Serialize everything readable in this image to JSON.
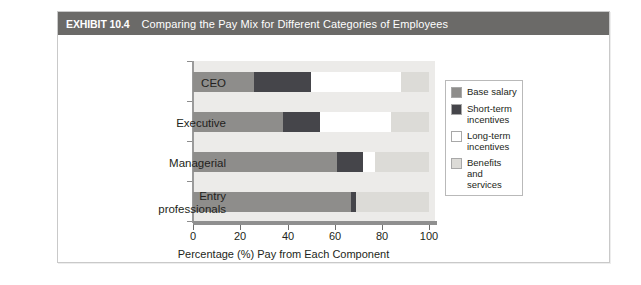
{
  "header": {
    "tag": "EXHIBIT 10.4",
    "title": "Comparing the Pay Mix for Different Categories of Employees"
  },
  "chart_data": {
    "type": "bar",
    "orientation": "horizontal",
    "stacked": true,
    "stack_mode": "percent",
    "title": "Comparing the Pay Mix for Different Categories of Employees",
    "xlabel": "Percentage (%) Pay from Each Component",
    "ylabel": "",
    "xlim": [
      0,
      100
    ],
    "xticks": [
      0,
      20,
      40,
      60,
      80,
      100
    ],
    "xticklabels": [
      "0",
      "20",
      "40",
      "60",
      "80",
      "100"
    ],
    "grid": false,
    "legend_position": "right",
    "categories": [
      "CEO",
      "Executive",
      "Managerial",
      "Entry professionals"
    ],
    "category_labels": [
      {
        "line1": "CEO",
        "line2": ""
      },
      {
        "line1": "Executive",
        "line2": ""
      },
      {
        "line1": "Managerial",
        "line2": ""
      },
      {
        "line1": "Entry",
        "line2": "professionals"
      }
    ],
    "series": [
      {
        "name": "Base salary",
        "color": "#8e8d8b",
        "values": [
          26,
          38,
          61,
          67
        ]
      },
      {
        "name": "Short-term incentives",
        "color": "#45454a",
        "values": [
          24,
          16,
          11,
          2
        ]
      },
      {
        "name": "Long-term incentives",
        "color": "#ffffff",
        "values": [
          38,
          30,
          5,
          0
        ]
      },
      {
        "name": "Benefits and services",
        "color": "#dcdbd7",
        "values": [
          12,
          16,
          23,
          31
        ]
      }
    ],
    "legend": [
      {
        "label_line1": "Base salary",
        "label_line2": "",
        "color": "#8e8d8b"
      },
      {
        "label_line1": "Short-term",
        "label_line2": "incentives",
        "color": "#45454a"
      },
      {
        "label_line1": "Long-term",
        "label_line2": "incentives",
        "color": "#ffffff"
      },
      {
        "label_line1": "Benefits and",
        "label_line2": "services",
        "color": "#dcdbd7"
      }
    ]
  },
  "colors": {
    "header_bar": "#6b6a68",
    "plot_background": "#ecebe9",
    "card_border": "#c9c9c9",
    "axis": "#8f8f8f",
    "text": "#231f20"
  }
}
